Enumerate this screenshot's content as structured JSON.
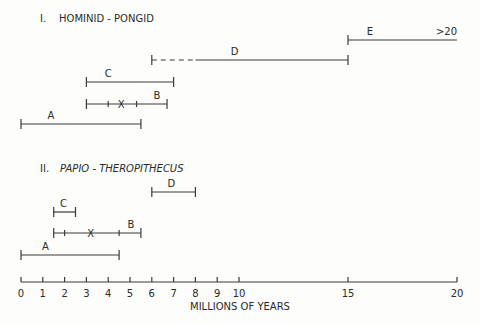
{
  "chart_data": {
    "type": "range-timeline",
    "xlabel": "MILLIONS OF YEARS",
    "xlim": [
      0,
      20
    ],
    "ticks": [
      0,
      1,
      2,
      3,
      4,
      5,
      6,
      7,
      8,
      9,
      10,
      15,
      20
    ],
    "tick_labels": [
      "0",
      "1",
      "2",
      "3",
      "4",
      "5",
      "6",
      "7",
      "8",
      "9",
      "10",
      "15",
      "20"
    ],
    "panels": [
      {
        "numeral": "I.",
        "title": "HOMINID - PONGID",
        "italic": false,
        "ranges": [
          {
            "label": "E",
            "start": 15,
            "end": 20,
            "end_label": ">20",
            "open_end": true
          },
          {
            "label": "D",
            "start": 6,
            "end": 15,
            "dashed_until": 8
          },
          {
            "label": "C",
            "start": 3,
            "end": 7
          },
          {
            "label": "B",
            "start": 3,
            "end": 6.7,
            "inner_ticks": [
              4,
              5.3
            ],
            "mean": 4.6
          },
          {
            "label": "A",
            "start": 0,
            "end": 5.5
          }
        ]
      },
      {
        "numeral": "II.",
        "title": "PAPIO - THEROPITHECUS",
        "italic": true,
        "ranges": [
          {
            "label": "D",
            "start": 6,
            "end": 8
          },
          {
            "label": "C",
            "start": 1.5,
            "end": 2.5
          },
          {
            "label": "B",
            "start": 1.5,
            "end": 5.5,
            "inner_ticks": [
              2,
              4.5
            ],
            "mean": 3.2
          },
          {
            "label": "A",
            "start": 0,
            "end": 4.5
          }
        ]
      }
    ]
  },
  "panel1": {
    "numeral": "I.",
    "title": "HOMINID - PONGID"
  },
  "panel2": {
    "numeral": "II.",
    "title": "PAPIO - THEROPITHECUS"
  },
  "axis": {
    "xlabel": "MILLIONS OF YEARS"
  }
}
